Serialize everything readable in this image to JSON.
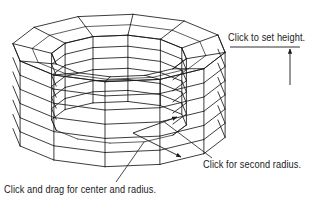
{
  "figure": {
    "colors": {
      "background": "#ffffff",
      "lines": "#1a1a1a"
    },
    "annotations": {
      "height": "Click to set height.",
      "second_radius": "Click for second radius.",
      "center_radius": "Click and drag for center and radius."
    },
    "wireframe": {
      "segments": 12,
      "height_rings": 6,
      "outer": {
        "cx": 119,
        "cy_top": 48,
        "cy_bottom": 133,
        "rx": 107,
        "ry": 34
      },
      "inner": {
        "cx": 119,
        "cy_top": 56,
        "rx": 68,
        "ry": 21
      }
    }
  }
}
